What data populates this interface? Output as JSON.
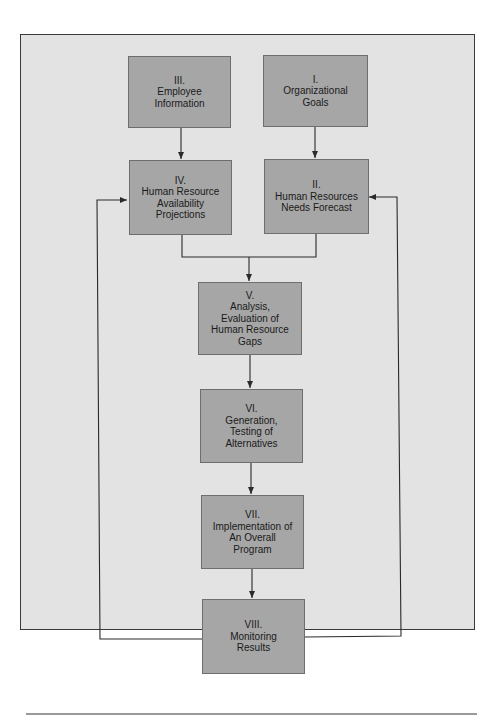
{
  "diagram": {
    "type": "flowchart",
    "title": "",
    "colors": {
      "background": "#e3e3e3",
      "box_fill": "#a6a6a6",
      "box_border": "#6e6e6e",
      "line": "#2a2a2a",
      "frame_border": "#3a3a3a"
    },
    "boxes": [
      {
        "id": "III",
        "numeral": "III.",
        "lines": [
          "Employee",
          "Information"
        ]
      },
      {
        "id": "I",
        "numeral": "I.",
        "lines": [
          "Organizational",
          "Goals"
        ]
      },
      {
        "id": "IV",
        "numeral": "IV.",
        "lines": [
          "Human Resource",
          "Availability",
          "Projections"
        ]
      },
      {
        "id": "II",
        "numeral": "II.",
        "lines": [
          "Human Resources",
          "Needs Forecast"
        ]
      },
      {
        "id": "V",
        "numeral": "V.",
        "lines": [
          "Analysis,",
          "Evaluation of",
          "Human Resource",
          "Gaps"
        ]
      },
      {
        "id": "VI",
        "numeral": "VI.",
        "lines": [
          "Generation,",
          "Testing of",
          "Alternatives"
        ]
      },
      {
        "id": "VII",
        "numeral": "VII.",
        "lines": [
          "Implementation of",
          "An Overall",
          "Program"
        ]
      },
      {
        "id": "VIII",
        "numeral": "VIII.",
        "lines": [
          "Monitoring",
          "Results"
        ]
      }
    ],
    "edges": [
      {
        "from": "III",
        "to": "IV"
      },
      {
        "from": "I",
        "to": "II"
      },
      {
        "from": "IV",
        "to": "V"
      },
      {
        "from": "II",
        "to": "V"
      },
      {
        "from": "V",
        "to": "VI"
      },
      {
        "from": "VI",
        "to": "VII"
      },
      {
        "from": "VII",
        "to": "VIII"
      },
      {
        "from": "VIII",
        "to": "IV",
        "kind": "feedback-left"
      },
      {
        "from": "VIII",
        "to": "II",
        "kind": "feedback-right"
      }
    ]
  }
}
